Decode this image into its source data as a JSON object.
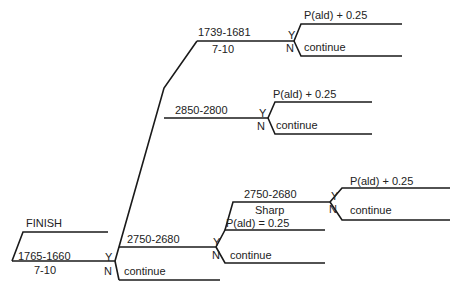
{
  "diagram": {
    "root": {
      "label": "FINISH"
    },
    "n1": {
      "range": "1765-1660",
      "sub": "7-10",
      "yes": "Y",
      "no": "N",
      "no_label": "continue"
    },
    "n2": {
      "range": "2750-2680",
      "yes": "Y",
      "no": "N",
      "yes_label": "P(ald) = 0.25",
      "no_label": "continue"
    },
    "n3": {
      "range": "2750-2680",
      "sub": "Sharp",
      "yes": "Y",
      "no": "N",
      "yes_label": "P(ald) + 0.25",
      "no_label": "continue"
    },
    "n4": {
      "range": "2850-2800",
      "yes": "Y",
      "no": "N",
      "yes_label": "P(ald) + 0.25",
      "no_label": "continue"
    },
    "n5": {
      "range": "1739-1681",
      "sub": "7-10",
      "yes": "Y",
      "no": "N",
      "yes_label": "P(ald) + 0.25",
      "no_label": "continue"
    }
  },
  "colors": {
    "line": "#1a1a1a",
    "text": "#222222",
    "background": "#ffffff"
  }
}
